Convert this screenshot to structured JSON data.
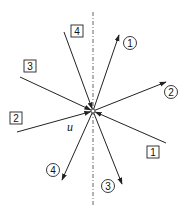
{
  "diagram": {
    "type": "vector-star",
    "center": {
      "x": 93,
      "y": 111
    },
    "center_label": "u",
    "axis": {
      "style": "dash-dot",
      "x": 93,
      "y1": 12,
      "y2": 207
    },
    "incoming": [
      {
        "label": "1",
        "from": {
          "x": 166,
          "y": 143
        },
        "box": {
          "x": 147,
          "y": 146
        }
      },
      {
        "label": "2",
        "from": {
          "x": 17,
          "y": 132
        },
        "box": {
          "x": 10,
          "y": 112
        }
      },
      {
        "label": "3",
        "from": {
          "x": 20,
          "y": 77
        },
        "box": {
          "x": 24,
          "y": 60
        }
      },
      {
        "label": "4",
        "from": {
          "x": 64,
          "y": 32
        },
        "box": {
          "x": 71,
          "y": 25
        }
      }
    ],
    "outgoing": [
      {
        "label": "1",
        "to": {
          "x": 119,
          "y": 35
        },
        "circle": {
          "x": 130,
          "y": 43
        }
      },
      {
        "label": "2",
        "to": {
          "x": 166,
          "y": 82
        },
        "circle": {
          "x": 171,
          "y": 92
        }
      },
      {
        "label": "3",
        "to": {
          "x": 122,
          "y": 184
        },
        "circle": {
          "x": 108,
          "y": 186
        }
      },
      {
        "label": "4",
        "to": {
          "x": 62,
          "y": 180
        },
        "circle": {
          "x": 53,
          "y": 170
        }
      }
    ],
    "colors": {
      "stroke": "#222222",
      "background": "#ffffff"
    }
  }
}
